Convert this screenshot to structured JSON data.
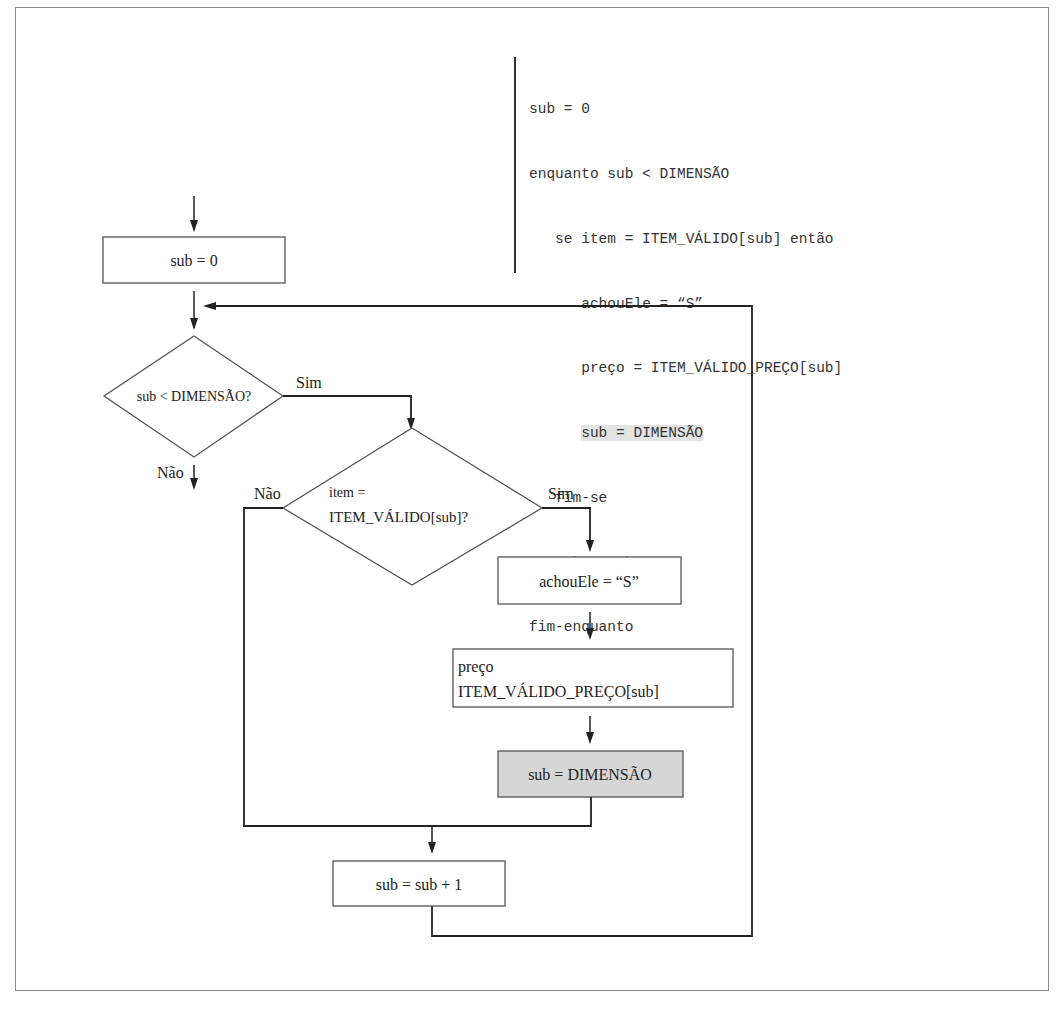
{
  "pseudocode": {
    "lines": [
      {
        "indent": 0,
        "text": "sub = 0",
        "highlight": false
      },
      {
        "indent": 0,
        "text": "enquanto sub < DIMENSÃO",
        "highlight": false
      },
      {
        "indent": 1,
        "text": "se item = ITEM_VÁLIDO[sub] então",
        "highlight": false
      },
      {
        "indent": 2,
        "text": "achouEle = “S”",
        "highlight": false
      },
      {
        "indent": 2,
        "text": "preço = ITEM_VÁLIDO_PREÇO[sub]",
        "highlight": false
      },
      {
        "indent": 2,
        "text": "sub = DIMENSÃO",
        "highlight": true
      },
      {
        "indent": 1,
        "text": "fim-se",
        "highlight": false
      },
      {
        "indent": 1,
        "text": "sub = sub + 1",
        "highlight": false
      },
      {
        "indent": 0,
        "text": "fim-enquanto",
        "highlight": false
      }
    ]
  },
  "flowchart": {
    "init_box": "sub = 0",
    "loop_condition": "sub < DIMENSÃO?",
    "loop_yes_label": "Sim",
    "loop_no_label": "Não",
    "item_condition_line1": "item =",
    "item_condition_line2": "ITEM_VÁLIDO[sub]?",
    "item_yes_label": "Sim",
    "item_no_label": "Não",
    "found_box": "achouEle = “S”",
    "price_box_line1": "preço",
    "price_box_line2": "ITEM_VÁLIDO_PREÇO[sub]",
    "exit_box": "sub = DIMENSÃO",
    "increment_box": "sub = sub + 1"
  },
  "colors": {
    "line": "#222222",
    "highlight_fill": "#d6d6d6",
    "code_highlight": "#e3e3e3",
    "frame": "#8a8a8a"
  }
}
